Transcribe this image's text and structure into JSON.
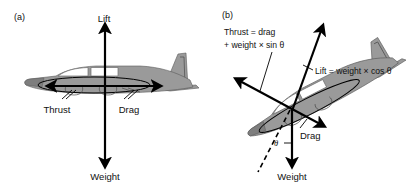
{
  "figure": {
    "background_color": "#ffffff",
    "ink_color": "#000000",
    "aircraft_fill_color": "#9a9a9a",
    "aircraft_window_color": "#ffffff"
  },
  "panels": [
    {
      "id": "a",
      "label": "(a)",
      "description": "level-flight force balance on light twin aircraft",
      "aircraft_heading": "nose-left, level",
      "pitch_angle_deg": 0,
      "forces": [
        {
          "name": "lift",
          "label": "Lift",
          "direction": "up"
        },
        {
          "name": "weight",
          "label": "Weight",
          "direction": "down"
        },
        {
          "name": "thrust",
          "label": "Thrust",
          "direction": "forward-left"
        },
        {
          "name": "drag",
          "label": "Drag",
          "direction": "aft-right"
        }
      ]
    },
    {
      "id": "b",
      "label": "(b)",
      "description": "climbing-flight force balance with climb angle theta",
      "aircraft_heading": "nose-up-left, climbing",
      "pitch_angle_deg": 27,
      "angle_symbol": "θ",
      "forces": [
        {
          "name": "thrust",
          "label": "Thrust = drag",
          "label_line2": "+ weight × sin θ",
          "direction": "forward-up-left"
        },
        {
          "name": "lift",
          "label": "Lift = weight × cos θ",
          "direction": "up-right-perpendicular"
        },
        {
          "name": "drag",
          "label": "Drag",
          "direction": "aft-down-right"
        },
        {
          "name": "weight",
          "label": "Weight",
          "direction": "down"
        }
      ]
    }
  ],
  "labels": {
    "panel_a": "(a)",
    "panel_b": "(b)",
    "a_lift": "Lift",
    "a_weight": "Weight",
    "a_thrust": "Thrust",
    "a_drag": "Drag",
    "b_thrust_line1": "Thrust = drag",
    "b_thrust_line2": "+ weight × sin θ",
    "b_lift": "Lift = weight × cos θ",
    "b_drag": "Drag",
    "b_weight": "Weight",
    "b_theta": "θ"
  }
}
